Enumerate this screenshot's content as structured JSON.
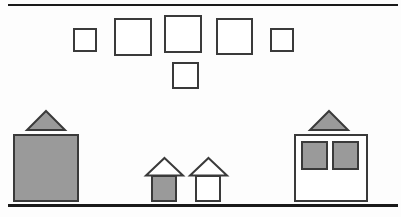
{
  "diagram": {
    "background_color": "#fdfdfd",
    "outline_color": "#3a3a3a",
    "fill_color": "#9a9a9a",
    "rule_color": "#1a1a1a",
    "rules": [
      {
        "name": "top-horizontal-rule",
        "x": 8,
        "y": 4,
        "width": 390,
        "height": 2
      },
      {
        "name": "bottom-horizontal-rule",
        "x": 8,
        "y": 204,
        "width": 390,
        "height": 3
      }
    ],
    "top_row_squares": [
      {
        "label": "square-1",
        "x": 73,
        "y": 28,
        "size": 24,
        "fill": "none"
      },
      {
        "label": "square-2",
        "x": 114,
        "y": 18,
        "size": 38,
        "fill": "none"
      },
      {
        "label": "square-3",
        "x": 164,
        "y": 15,
        "size": 38,
        "fill": "none"
      },
      {
        "label": "square-4",
        "x": 216,
        "y": 18,
        "size": 37,
        "fill": "none"
      },
      {
        "label": "square-5",
        "x": 270,
        "y": 28,
        "size": 24,
        "fill": "none"
      }
    ],
    "second_row_squares": [
      {
        "label": "square-6",
        "x": 172,
        "y": 62,
        "size": 27,
        "fill": "none"
      }
    ],
    "left_building": {
      "name": "large-filled-house",
      "body": {
        "x": 13,
        "y": 134,
        "width": 66,
        "height": 68,
        "fill": "gray"
      },
      "roof": {
        "x": 26,
        "y": 110,
        "width": 40,
        "height": 20,
        "fill": "gray"
      }
    },
    "center_houses": [
      {
        "name": "small-house-filled",
        "body": {
          "x": 151,
          "y": 175,
          "width": 26,
          "height": 27,
          "fill": "gray"
        },
        "roof": {
          "x": 145,
          "y": 158,
          "width": 38,
          "height": 18,
          "fill": "none"
        }
      },
      {
        "name": "small-house-outline",
        "body": {
          "x": 195,
          "y": 175,
          "width": 26,
          "height": 27,
          "fill": "none"
        },
        "roof": {
          "x": 189,
          "y": 158,
          "width": 38,
          "height": 18,
          "fill": "none"
        }
      }
    ],
    "right_building": {
      "name": "windowed-house",
      "body": {
        "x": 294,
        "y": 134,
        "width": 74,
        "height": 68,
        "fill": "none"
      },
      "roof": {
        "x": 309,
        "y": 110,
        "width": 40,
        "height": 20,
        "fill": "gray"
      },
      "windows": [
        {
          "label": "window-left",
          "x": 301,
          "y": 141,
          "width": 27,
          "height": 29,
          "fill": "gray"
        },
        {
          "label": "window-right",
          "x": 332,
          "y": 141,
          "width": 27,
          "height": 29,
          "fill": "gray"
        }
      ]
    }
  }
}
